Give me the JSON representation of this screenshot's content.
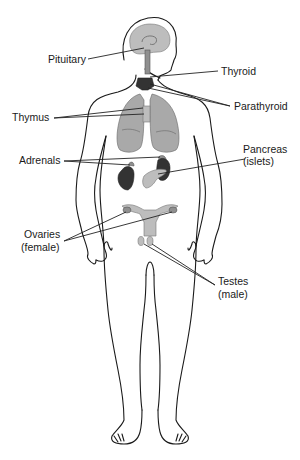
{
  "labels": {
    "pituitary": "Pituitary",
    "thyroid": "Thyroid",
    "parathyroid": "Parathyroid",
    "thymus": "Thymus",
    "adrenals": "Adrenals",
    "pancreas_line1": "Pancreas",
    "pancreas_line2": "(islets)",
    "ovaries_line1": "Ovaries",
    "ovaries_line2": "(female)",
    "testes_line1": "Testes",
    "testes_line2": "(male)"
  },
  "colors": {
    "outline": "#1a1a1a",
    "organ_light": "#a9a9a9",
    "organ_dark": "#333333",
    "background": "#ffffff"
  }
}
